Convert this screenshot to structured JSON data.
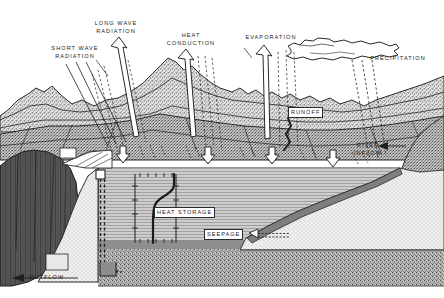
{
  "diagram": {
    "type": "cross-section-illustration",
    "style": "black-and-white stippled line drawing",
    "palette": {
      "background": "#ffffff",
      "ink": "#1a1a1a",
      "water_fill": "#c9c9c9",
      "mountain_fill": "#d6d6d6",
      "dam_fill": "#e4e4e4",
      "cliff_dark": "#4a4a4a",
      "lakebed_fill": "#dcdcdc",
      "bedrock_fill": "#b4b4b4",
      "sediment_fill": "#8f8f8f"
    },
    "labels": [
      {
        "id": "long-wave-radiation",
        "text": "LONG WAVE\nRADIATION",
        "x": 84,
        "y": 20,
        "boxed": false,
        "direction": "up"
      },
      {
        "id": "short-wave-radiation",
        "text": "SHORT WAVE\nRADIATION",
        "x": 42,
        "y": 45,
        "boxed": false,
        "direction": "down"
      },
      {
        "id": "heat-conduction",
        "text": "HEAT\nCONDUCTION",
        "x": 166,
        "y": 32,
        "boxed": false,
        "direction": "up"
      },
      {
        "id": "evaporation",
        "text": "EVAPORATION",
        "x": 241,
        "y": 34,
        "boxed": false,
        "direction": "up"
      },
      {
        "id": "precipitation",
        "text": "PRECIPITATION",
        "x": 366,
        "y": 55,
        "boxed": false,
        "direction": "down"
      },
      {
        "id": "runoff",
        "text": "RUNOFF",
        "x": 291,
        "y": 108,
        "boxed": true,
        "direction": "down"
      },
      {
        "id": "river-inflow",
        "text": "RIVER\nINFLOW",
        "x": 352,
        "y": 144,
        "boxed": false,
        "direction": "left"
      },
      {
        "id": "heat-storage",
        "text": "HEAT STORAGE",
        "x": 155,
        "y": 208,
        "boxed": true,
        "direction": "none"
      },
      {
        "id": "seepage",
        "text": "SEEPAGE",
        "x": 205,
        "y": 230,
        "boxed": true,
        "direction": "right"
      },
      {
        "id": "outflow",
        "text": "OUTFLOW",
        "x": 31,
        "y": 277,
        "boxed": false,
        "direction": "left"
      }
    ],
    "features": [
      {
        "id": "cloud",
        "name": "cloud"
      },
      {
        "id": "mountain-range",
        "name": "mountain-range"
      },
      {
        "id": "dam-embankment",
        "name": "dam-embankment"
      },
      {
        "id": "reservoir-water",
        "name": "reservoir-water-body"
      },
      {
        "id": "thermocline-profile",
        "name": "temperature-depth-profile"
      },
      {
        "id": "lake-bed",
        "name": "lake-bed-slope"
      },
      {
        "id": "bedrock",
        "name": "bedrock-layer"
      },
      {
        "id": "intake-tower",
        "name": "intake-tower"
      },
      {
        "id": "penstock",
        "name": "penstock-conduit"
      },
      {
        "id": "spillway",
        "name": "spillway"
      }
    ]
  }
}
